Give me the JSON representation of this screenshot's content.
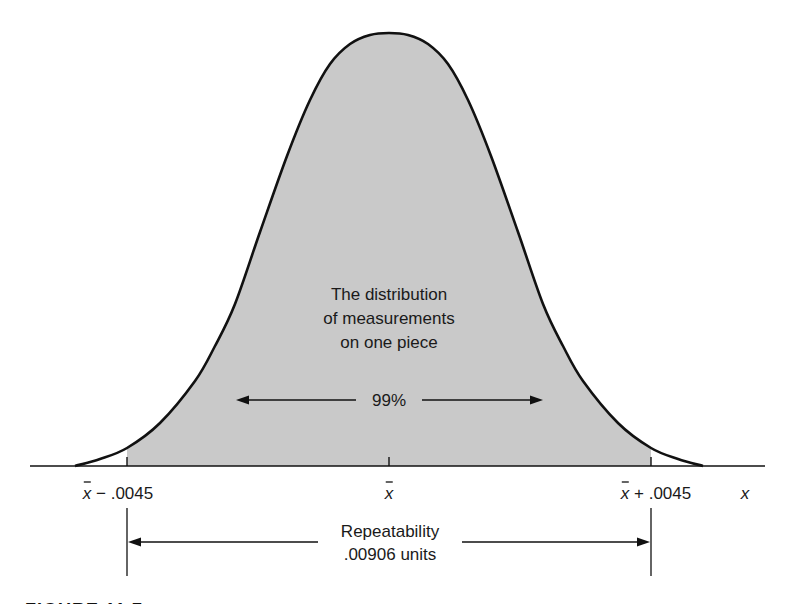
{
  "figure": {
    "colors": {
      "fill": "#c9c9c9",
      "stroke": "#111111",
      "background": "#ffffff"
    },
    "axis": {
      "baseline_y": 466,
      "x_start": 30,
      "x_end": 765,
      "axis_label": "x"
    },
    "curve": {
      "center_x": 389,
      "peak_y": 33,
      "half_profile": [
        [
          75,
          466
        ],
        [
          100,
          459
        ],
        [
          127,
          448
        ],
        [
          160,
          423
        ],
        [
          195,
          381
        ],
        [
          215,
          346
        ],
        [
          235,
          304
        ],
        [
          260,
          232
        ],
        [
          287,
          156
        ],
        [
          310,
          100
        ],
        [
          330,
          64
        ],
        [
          350,
          44
        ],
        [
          370,
          35
        ],
        [
          389,
          33
        ]
      ]
    },
    "shaded_region": {
      "x_from": 127,
      "x_to": 651
    },
    "ticks": [
      {
        "x": 127,
        "label_prefix": "x",
        "label_suffix": " − .0045",
        "label_x": 118,
        "name": "tick-lower-limit"
      },
      {
        "x": 389,
        "label_prefix": "x",
        "label_suffix": "",
        "label_x": 389,
        "name": "tick-mean"
      },
      {
        "x": 651,
        "label_prefix": "x",
        "label_suffix": " + .0045",
        "label_x": 656,
        "name": "tick-upper-limit"
      }
    ],
    "center_text": [
      "The distribution",
      "of measurements",
      "on one piece"
    ],
    "inner_arrow": {
      "label": "99%",
      "x_from": 236,
      "x_to": 543,
      "y": 400,
      "gap_from": 356,
      "gap_to": 422
    },
    "repeatability": {
      "line1": "Repeatability",
      "line2": ".00906 units",
      "x_from": 128,
      "x_to": 650,
      "y": 542,
      "gap_from": 318,
      "gap_to": 462,
      "vertical_top": 508,
      "vertical_bottom": 576
    },
    "caption": "FIGURE 11.7"
  }
}
